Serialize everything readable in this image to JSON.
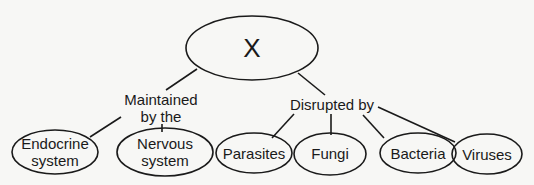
{
  "diagram": {
    "root": {
      "label": "X"
    },
    "branches": [
      {
        "relation": "Maintained by the",
        "relation_lines": [
          "Maintained",
          "by the"
        ],
        "children": [
          {
            "label_lines": [
              "Endocrine",
              "system"
            ]
          },
          {
            "label_lines": [
              "Nervous",
              "system"
            ]
          }
        ]
      },
      {
        "relation": "Disrupted by",
        "relation_lines": [
          "Disrupted by"
        ],
        "children": [
          {
            "label_lines": [
              "Parasites"
            ]
          },
          {
            "label_lines": [
              "Fungi"
            ]
          },
          {
            "label_lines": [
              "Bacteria"
            ]
          },
          {
            "label_lines": [
              "Viruses"
            ]
          }
        ]
      }
    ]
  },
  "colors": {
    "stroke": "#1a1a1a",
    "background": "#f7f7f5"
  }
}
